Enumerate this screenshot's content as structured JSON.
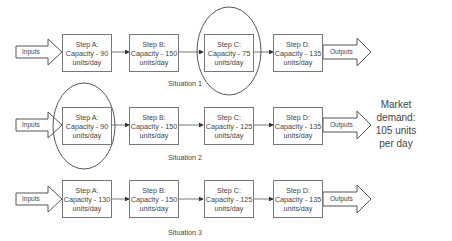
{
  "situations": [
    {
      "label": "Situation 1",
      "input_label": "Inputs",
      "output_label": "Outputs",
      "highlighted_step": "Step C",
      "steps": [
        {
          "name": "Step A:",
          "capacity": "Capacity - 90",
          "unit": "units/day"
        },
        {
          "name": "Step B:",
          "capacity": "Capacity - 150",
          "unit": "units/day"
        },
        {
          "name": "Step C:",
          "capacity": "Capacity - 75",
          "unit": "units/day"
        },
        {
          "name": "Step D:",
          "capacity": "Capacity - 135",
          "unit": "units/day"
        }
      ]
    },
    {
      "label": "Situation 2",
      "input_label": "Inputs",
      "output_label": "Outputs",
      "highlighted_step": "Step A",
      "steps": [
        {
          "name": "Step A:",
          "capacity": "Capacity - 90",
          "unit": "units/day"
        },
        {
          "name": "Step B:",
          "capacity": "Capacity - 150",
          "unit": "units/day"
        },
        {
          "name": "Step C:",
          "capacity": "Capacity - 125",
          "unit": "units/day"
        },
        {
          "name": "Step D:",
          "capacity": "Capacity - 135",
          "unit": "units/day"
        }
      ]
    },
    {
      "label": "Situation 3",
      "input_label": "Inputs",
      "output_label": "Outputs",
      "highlighted_step": "",
      "steps": [
        {
          "name": "Step A:",
          "capacity": "Capacity - 130",
          "unit": "units/day"
        },
        {
          "name": "Step B:",
          "capacity": "Capacity - 150",
          "unit": "units/day"
        },
        {
          "name": "Step C:",
          "capacity": "Capacity - 125",
          "unit": "units/day"
        },
        {
          "name": "Step D:",
          "capacity": "Capacity - 135",
          "unit": "units/day"
        }
      ]
    }
  ],
  "market_demand": {
    "line1": "Market",
    "line2": "demand:",
    "line3": "105 units",
    "line4": "per day"
  },
  "colors": {
    "stroke": "#555555",
    "text": "#444444",
    "background": "#ffffff"
  }
}
